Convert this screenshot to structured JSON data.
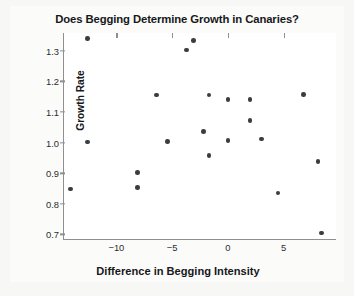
{
  "chart_data": {
    "type": "scatter",
    "title": "Does Begging Determine Growth in Canaries?",
    "xlabel": "Difference in Begging Intensity",
    "ylabel": "Growth Rate",
    "xlim": [
      -14.7,
      9.8
    ],
    "ylim": [
      0.682,
      1.358
    ],
    "grid": false,
    "legend": null,
    "xticks": [
      -10,
      -5,
      0,
      5
    ],
    "xtick_labels": [
      "−10",
      "−5",
      "0",
      "5"
    ],
    "yticks": [
      0.7,
      0.8,
      0.9,
      1.0,
      1.1,
      1.2,
      1.3
    ],
    "ytick_labels": [
      "0.7",
      "0.8",
      "0.9",
      "1.0",
      "1.1",
      "1.2",
      "1.3"
    ],
    "marker": {
      "shape": "circle",
      "color": "#3a3d40",
      "size_px": 4.6
    },
    "points": [
      {
        "x": -12.6,
        "y": 1.34
      },
      {
        "x": -12.6,
        "y": 1.002
      },
      {
        "x": -14.1,
        "y": 0.849
      },
      {
        "x": -8.1,
        "y": 0.903
      },
      {
        "x": -8.1,
        "y": 0.853
      },
      {
        "x": -6.4,
        "y": 1.155
      },
      {
        "x": -5.4,
        "y": 1.004
      },
      {
        "x": -3.1,
        "y": 1.334
      },
      {
        "x": -3.7,
        "y": 1.302
      },
      {
        "x": -2.2,
        "y": 1.037
      },
      {
        "x": -1.7,
        "y": 1.155
      },
      {
        "x": -1.7,
        "y": 0.957
      },
      {
        "x": 0.0,
        "y": 1.141
      },
      {
        "x": 0.0,
        "y": 1.006
      },
      {
        "x": 2.0,
        "y": 1.141
      },
      {
        "x": 2.0,
        "y": 1.073
      },
      {
        "x": 3.0,
        "y": 1.012
      },
      {
        "x": 4.5,
        "y": 0.836
      },
      {
        "x": 6.8,
        "y": 1.157
      },
      {
        "x": 8.1,
        "y": 0.938
      },
      {
        "x": 8.4,
        "y": 0.705
      }
    ]
  },
  "colors": {
    "marker": "#3a3d40",
    "axis": "#8d8f90",
    "text": "#16181a",
    "plot_background": "#ffffff",
    "page_background": "#f7f7f6"
  }
}
